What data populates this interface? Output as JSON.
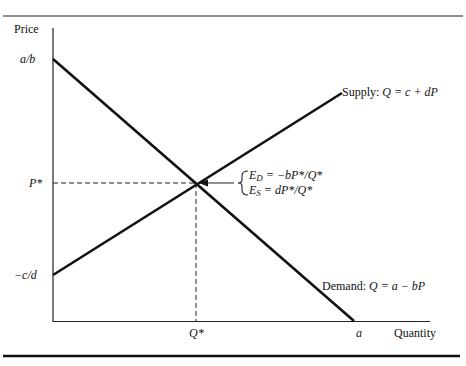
{
  "diagram": {
    "type": "supply-demand",
    "axes": {
      "y_label": "Price",
      "x_label": "Quantity"
    },
    "y_ticks": {
      "intercept_demand": "a/b",
      "equilibrium_price": "P*",
      "intercept_supply": "−c/d"
    },
    "x_ticks": {
      "equilibrium_quantity": "Q*",
      "intercept_demand": "a"
    },
    "supply": {
      "label_prefix": "Supply: ",
      "equation": "Q = c + dP"
    },
    "demand": {
      "label_prefix": "Demand: ",
      "equation": "Q = a − bP"
    },
    "elasticities": {
      "demand_prefix": "E",
      "demand_sub": "D",
      "demand_expr": " = −bP*/Q*",
      "supply_prefix": "E",
      "supply_sub": "S",
      "supply_expr": " = dP*/Q*"
    },
    "colors": {
      "line": "#111111",
      "background": "#ffffff"
    }
  }
}
